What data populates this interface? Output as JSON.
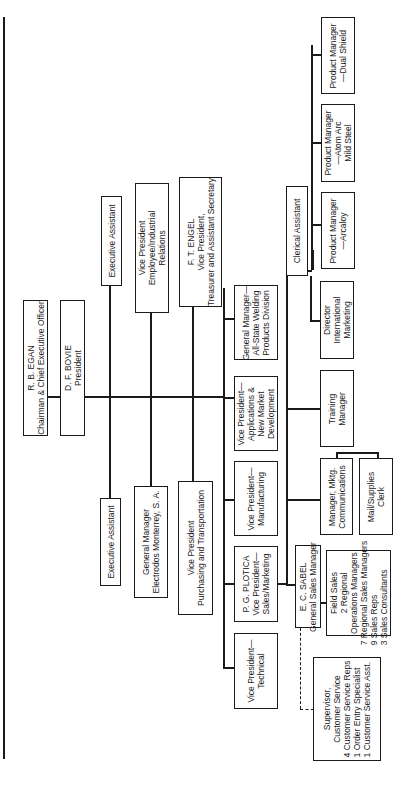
{
  "chart": {
    "chairman": {
      "name": "R. B. EGAN",
      "title": "Chairman & Chief Executive Officer"
    },
    "president": {
      "name": "D. F. BOVIE",
      "title": "President"
    },
    "exec_assistant_left": "Executive Assistant",
    "gm_monterrey": {
      "line1": "General Manager",
      "line2": "Electrodos Monterrey, S. A."
    },
    "vp_purchasing": {
      "line1": "Vice President",
      "line2": "Purchasing and Transportation"
    },
    "exec_assistant_right": "Executive Assistant",
    "vp_employee": {
      "line1": "Vice President",
      "line2": "Employee/Industrial",
      "line3": "Relations"
    },
    "vp_treasurer": {
      "name": "F. T. ENGEL",
      "line1": "Vice President,",
      "line2": "Treasurer and Assistant Secretary"
    },
    "vp_technical": {
      "line1": "Vice President—",
      "line2": "Technical"
    },
    "vp_sales": {
      "name": "P. G. PLOTICA",
      "line1": "Vice President—",
      "line2": "Sales/Marketing"
    },
    "vp_manufacturing": {
      "line1": "Vice President—",
      "line2": "Manufacturing"
    },
    "vp_applications": {
      "line1": "Vice President—",
      "line2": "Applications &",
      "line3": "New Market",
      "line4": "Development"
    },
    "gm_allstate": {
      "line1": "General Manager—",
      "line2": "All-State Welding",
      "line3": "Products Division"
    },
    "gsm": {
      "name": "E. C. SABEL",
      "title": "General Sales Manager"
    },
    "field_sales": {
      "line1": "Field Sales",
      "line2": "2 Regional",
      "line3": "Operations Managers",
      "line4": "7 Regional Sales Managers",
      "line5": "9 Sales Reps",
      "line6": "3 Sales Consultants"
    },
    "customer_service": {
      "line1": "Supervisor,",
      "line2": "Customer Service",
      "line3": "4 Customer Service Reps",
      "line4": "1 Order Entry Specialist",
      "line5": "1 Customer Service Asst."
    },
    "mktg_comm": {
      "line1": "Manager, Mktg.",
      "line2": "Communications"
    },
    "mail_clerk": {
      "line1": "Mail/Supplies",
      "line2": "Clerk"
    },
    "training": {
      "line1": "Training",
      "line2": "Manager"
    },
    "dir_intl": {
      "line1": "Director",
      "line2": "International",
      "line3": "Marketing"
    },
    "clerical": "Clerical Assistant",
    "pm_arcaloy": {
      "line1": "Product Manager",
      "line2": "—Arcaloy"
    },
    "pm_atomarc": {
      "line1": "Product Manager",
      "line2": "—Atom Arc",
      "line3": "Mild Steel"
    },
    "pm_dualshield": {
      "line1": "Product Manager",
      "line2": "—Dual Shield"
    }
  }
}
